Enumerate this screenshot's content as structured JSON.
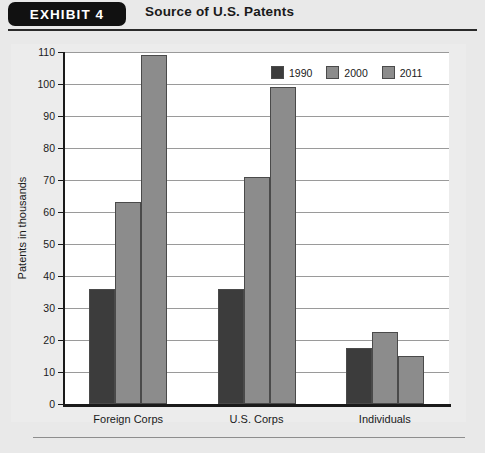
{
  "header": {
    "exhibit_tab": "EXHIBIT 4",
    "title": "Source of U.S. Patents"
  },
  "chart_data": {
    "type": "bar",
    "title": "Source of U.S. Patents",
    "xlabel": "",
    "ylabel": "Patents in thousands",
    "ylim": [
      0,
      110
    ],
    "ytick_step": 10,
    "yticks": [
      0,
      10,
      20,
      30,
      40,
      50,
      60,
      70,
      80,
      90,
      100,
      110
    ],
    "grid": true,
    "legend_position": "top-right",
    "categories": [
      "Foreign Corps",
      "U.S. Corps",
      "Individuals"
    ],
    "series": [
      {
        "name": "1990",
        "color": "#3c3c3c",
        "values": [
          36,
          36,
          17.5
        ]
      },
      {
        "name": "2000",
        "color": "#8c8c8c",
        "values": [
          63,
          71,
          22.5
        ]
      },
      {
        "name": "2011",
        "color": "#8c8c8c",
        "values": [
          109,
          99,
          15
        ]
      }
    ]
  },
  "colors": {
    "page_background": "#e9e9e9",
    "plot_background": "#ffffff",
    "axis": "#1a1a1a",
    "gridline": "#9a9a9a",
    "series_1990": "#3c3c3c",
    "series_2000": "#8c8c8c",
    "series_2011": "#8c8c8c"
  }
}
